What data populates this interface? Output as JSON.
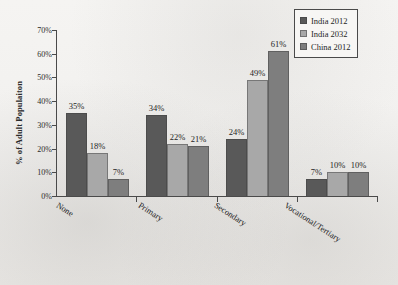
{
  "chart_data": {
    "type": "bar",
    "title": "",
    "subtitle": "",
    "xlabel": "",
    "ylabel": "% of Adult Populaiton",
    "categories": [
      "None",
      "Primary",
      "Secondary",
      "Vocational/Tertiary"
    ],
    "series": [
      {
        "name": "India 2012",
        "color": "#595959",
        "values": [
          35,
          18,
          24,
          7
        ],
        "value_labels": [
          "35%",
          "18%",
          "24%",
          "7%"
        ]
      },
      {
        "name": "India 2032",
        "color": "#a8a8a8",
        "values": [
          18,
          22,
          49,
          10
        ],
        "value_labels": [
          "18%",
          "22%",
          "49%",
          "10%"
        ]
      },
      {
        "name": "China 2012",
        "color": "#7e7e7e",
        "values": [
          7,
          21,
          61,
          10
        ],
        "value_labels": [
          "7%",
          "21%",
          "61%",
          "10%"
        ]
      }
    ],
    "series_by_category": {
      "None": {
        "India 2012": 35,
        "India 2032": 18,
        "China 2012": 7
      },
      "Primary": {
        "India 2012": 34,
        "India 2032": 22,
        "China 2012": 21
      },
      "Secondary": {
        "India 2012": 24,
        "India 2032": 49,
        "China 2012": 61
      },
      "Vocational/Tertiary": {
        "India 2012": 7,
        "India 2032": 10,
        "China 2012": 10
      }
    },
    "ylim": [
      0,
      70
    ],
    "ytick_step": 10,
    "ytick_labels": [
      "0%",
      "10%",
      "20%",
      "30%",
      "40%",
      "50%",
      "60%",
      "70%"
    ],
    "grid": false,
    "legend_position": "top-right",
    "category_label_rotation_deg": 33,
    "value_labels_shown": true
  },
  "legend": {
    "entries": [
      {
        "label": "India 2012",
        "color": "#595959"
      },
      {
        "label": "India 2032",
        "color": "#a8a8a8"
      },
      {
        "label": "China 2012",
        "color": "#7e7e7e"
      }
    ]
  },
  "bars": [
    {
      "category": "None",
      "series": "India 2012",
      "value": 35,
      "label": "35%"
    },
    {
      "category": "None",
      "series": "India 2032",
      "value": 18,
      "label": "18%"
    },
    {
      "category": "None",
      "series": "China 2012",
      "value": 7,
      "label": "7%"
    },
    {
      "category": "Primary",
      "series": "India 2012",
      "value": 34,
      "label": "34%"
    },
    {
      "category": "Primary",
      "series": "India 2032",
      "value": 22,
      "label": "22%"
    },
    {
      "category": "Primary",
      "series": "China 2012",
      "value": 21,
      "label": "21%"
    },
    {
      "category": "Secondary",
      "series": "India 2012",
      "value": 24,
      "label": "24%"
    },
    {
      "category": "Secondary",
      "series": "India 2032",
      "value": 49,
      "label": "49%"
    },
    {
      "category": "Secondary",
      "series": "China 2012",
      "value": 61,
      "label": "61%"
    },
    {
      "category": "Vocational/Tertiary",
      "series": "India 2012",
      "value": 7,
      "label": "7%"
    },
    {
      "category": "Vocational/Tertiary",
      "series": "India 2032",
      "value": 10,
      "label": "10%"
    },
    {
      "category": "Vocational/Tertiary",
      "series": "China 2012",
      "value": 10,
      "label": "10%"
    }
  ]
}
